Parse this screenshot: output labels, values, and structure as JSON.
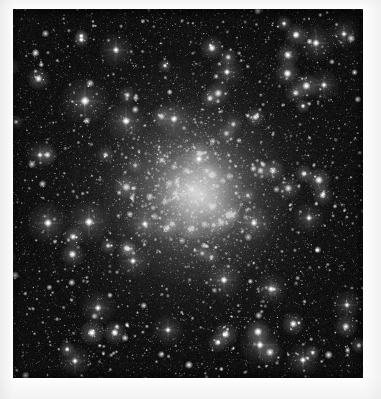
{
  "page": {
    "background_color": "#fdfdfd",
    "width": 381,
    "height": 399,
    "title": "Globular Cluster Image"
  },
  "image_plate": {
    "label": "globular-cluster-photograph",
    "alt_text": "Grayscale astronomical image of a dense globular star cluster",
    "sky_background_color": "#070707",
    "star_color": "#ffffff",
    "frame": {
      "x": 13,
      "y": 9,
      "width": 350,
      "height": 369
    },
    "observation_type": "optical grayscale star field",
    "core_center": {
      "x": 190,
      "y": 190
    },
    "core_radius_px": 44,
    "halo_radius_px": 165,
    "estimated_star_count": 9000
  },
  "chart_data": {
    "type": "scatter",
    "title": "",
    "xlabel": "",
    "ylabel": "",
    "xlim": [
      0,
      350
    ],
    "ylim": [
      0,
      369
    ],
    "grid": false,
    "legend": "none",
    "core": {
      "x": 177,
      "y": 181,
      "peak_brightness": 1.0
    },
    "density_profile": {
      "model": "king",
      "core_radius": 40,
      "tidal_radius": 300,
      "center_surface_density": 1.0,
      "edge_surface_density": 0.16
    },
    "populations": [
      {
        "name": "faint-field-stars",
        "count": 7200,
        "size_px": [
          0.5,
          1.4
        ],
        "brightness": [
          0.18,
          0.5
        ]
      },
      {
        "name": "mid-cluster-stars",
        "count": 1500,
        "size_px": [
          1.1,
          2.4
        ],
        "brightness": [
          0.45,
          0.8
        ]
      },
      {
        "name": "bright-giants",
        "count": 260,
        "size_px": [
          2.2,
          4.4
        ],
        "brightness": [
          0.78,
          1.0
        ]
      }
    ],
    "named_bright_stars": [
      {
        "x": 72,
        "y": 92,
        "mag_rel": 0.97,
        "size_px": 5.0
      },
      {
        "x": 113,
        "y": 112,
        "mag_rel": 0.92,
        "size_px": 4.2
      },
      {
        "x": 103,
        "y": 41,
        "mag_rel": 0.86,
        "size_px": 3.6
      },
      {
        "x": 161,
        "y": 110,
        "mag_rel": 0.88,
        "size_px": 3.8
      },
      {
        "x": 214,
        "y": 63,
        "mag_rel": 0.84,
        "size_px": 3.4
      },
      {
        "x": 303,
        "y": 34,
        "mag_rel": 0.9,
        "size_px": 3.9
      },
      {
        "x": 311,
        "y": 76,
        "mag_rel": 0.82,
        "size_px": 3.3
      },
      {
        "x": 331,
        "y": 25,
        "mag_rel": 0.8,
        "size_px": 3.1
      },
      {
        "x": 35,
        "y": 214,
        "mag_rel": 0.93,
        "size_px": 4.3
      },
      {
        "x": 76,
        "y": 213,
        "mag_rel": 0.95,
        "size_px": 4.6
      },
      {
        "x": 132,
        "y": 215,
        "mag_rel": 0.85,
        "size_px": 3.5
      },
      {
        "x": 120,
        "y": 252,
        "mag_rel": 0.83,
        "size_px": 3.4
      },
      {
        "x": 241,
        "y": 214,
        "mag_rel": 0.87,
        "size_px": 3.7
      },
      {
        "x": 296,
        "y": 209,
        "mag_rel": 0.81,
        "size_px": 3.2
      },
      {
        "x": 211,
        "y": 271,
        "mag_rel": 0.89,
        "size_px": 3.8
      },
      {
        "x": 258,
        "y": 280,
        "mag_rel": 0.84,
        "size_px": 3.4
      },
      {
        "x": 85,
        "y": 299,
        "mag_rel": 0.86,
        "size_px": 3.6
      },
      {
        "x": 155,
        "y": 321,
        "mag_rel": 0.82,
        "size_px": 3.3
      },
      {
        "x": 247,
        "y": 336,
        "mag_rel": 0.91,
        "size_px": 4.0
      },
      {
        "x": 290,
        "y": 351,
        "mag_rel": 0.85,
        "size_px": 3.5
      },
      {
        "x": 62,
        "y": 352,
        "mag_rel": 0.83,
        "size_px": 3.3
      },
      {
        "x": 334,
        "y": 296,
        "mag_rel": 0.8,
        "size_px": 3.1
      },
      {
        "x": 27,
        "y": 146,
        "mag_rel": 0.78,
        "size_px": 3.0
      },
      {
        "x": 186,
        "y": 150,
        "mag_rel": 0.88,
        "size_px": 3.7
      }
    ]
  }
}
